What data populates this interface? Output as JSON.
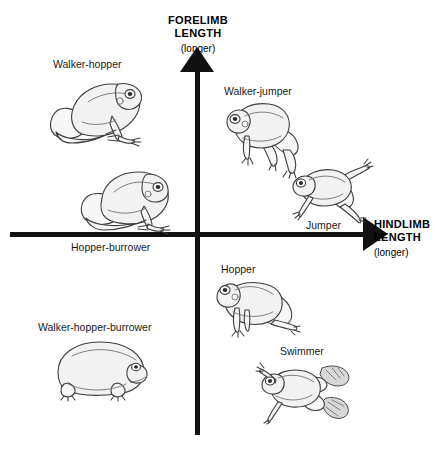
{
  "diagram": {
    "background_color": "#ffffff",
    "axis_color": "#111111",
    "frog_fill": "#f2f2f2",
    "frog_outline": "#3d3d3d"
  },
  "axes": {
    "vertical": {
      "title": "FORELIMB LENGTH",
      "title_line1": "FORELIMB",
      "title_line2": "LENGTH",
      "qualifier": "(longer)",
      "arrow": "arrow-up-icon"
    },
    "horizontal": {
      "title": "HINDLIMB LENGTH",
      "title_line1": "HINDLIMB",
      "title_line2": "LENGTH",
      "qualifier": "(longer)",
      "arrow": "arrow-right-icon"
    }
  },
  "specimens": [
    {
      "id": "walker-hopper",
      "label": "Walker-hopper",
      "quadrant": "upper-left",
      "icon": "frog-sitting-icon"
    },
    {
      "id": "walker-jumper",
      "label": "Walker-jumper",
      "quadrant": "upper-right",
      "icon": "frog-long-legged-icon"
    },
    {
      "id": "jumper",
      "label": "Jumper",
      "quadrant": "upper-right",
      "icon": "frog-leaping-icon"
    },
    {
      "id": "hopper-burrower",
      "label": "Hopper-burrower",
      "quadrant": "upper-left",
      "icon": "frog-squat-icon"
    },
    {
      "id": "hopper",
      "label": "Hopper",
      "quadrant": "lower-right",
      "icon": "frog-crouching-icon"
    },
    {
      "id": "walker-hopper-burrower",
      "label": "Walker-hopper-burrower",
      "quadrant": "lower-left",
      "icon": "frog-round-burrower-icon"
    },
    {
      "id": "swimmer",
      "label": "Swimmer",
      "quadrant": "lower-right",
      "icon": "frog-swimming-icon"
    }
  ]
}
